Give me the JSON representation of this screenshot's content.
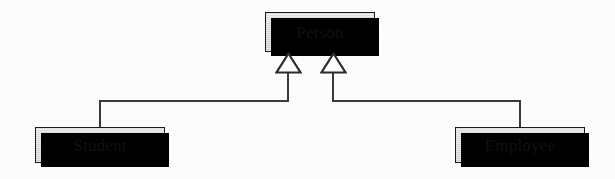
{
  "diagram": {
    "type": "uml-class-diagram",
    "relationship": "generalization",
    "background_color": "#fdfdfd",
    "box_fill_color": "#d6d6d6",
    "box_border_color": "#1a1a1a",
    "shadow_color": "#000000",
    "line_color": "#3a3a3a",
    "classes": [
      {
        "id": "person",
        "name": "Person",
        "role": "superclass",
        "x": 265,
        "y": 12,
        "width": 110,
        "height": 40
      },
      {
        "id": "student",
        "name": "Student",
        "role": "subclass",
        "x": 35,
        "y": 127,
        "width": 130,
        "height": 36
      },
      {
        "id": "employee",
        "name": "Employee",
        "role": "subclass",
        "x": 455,
        "y": 127,
        "width": 130,
        "height": 36
      }
    ],
    "generalizations": [
      {
        "id": "student-to-person",
        "from": "Student",
        "to": "Person",
        "arrowhead": "hollow-triangle",
        "arrow_x": 288,
        "elbow_y": 101
      },
      {
        "id": "employee-to-person",
        "from": "Employee",
        "to": "Person",
        "arrowhead": "hollow-triangle",
        "arrow_x": 333,
        "elbow_y": 101
      }
    ]
  }
}
